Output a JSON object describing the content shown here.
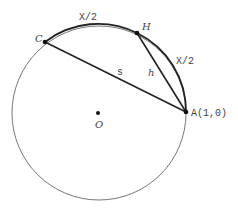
{
  "diagram": {
    "points": {
      "C": {
        "label": "C"
      },
      "H": {
        "label": "H"
      },
      "A": {
        "label": "A(1,0)"
      },
      "O": {
        "label": "O"
      }
    },
    "segments": {
      "CA": {
        "label": "s"
      },
      "HA": {
        "label": "h"
      }
    },
    "arcs": {
      "CH": {
        "label": "X/2"
      },
      "HA": {
        "label": "X/2"
      }
    },
    "colors": {
      "line": "#222222",
      "text": "#444444"
    }
  }
}
